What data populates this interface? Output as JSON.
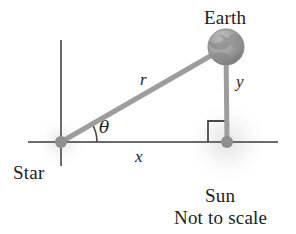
{
  "figure": {
    "type": "geometry-diagram",
    "caption": "Not to scale",
    "background_color": "#ffffff",
    "stroke_color": "#8a8a8a",
    "axis_color": "#6b6b6b",
    "text_color": "#1d1d1d"
  },
  "labels": {
    "earth": "Earth",
    "star": "Star",
    "sun": "Sun",
    "not_to_scale": "Not to scale",
    "r": "r",
    "x": "x",
    "y": "y",
    "theta": "θ"
  },
  "bodies": [
    {
      "name": "star",
      "label": "Star",
      "cx": 61,
      "cy": 142,
      "dot_radius": 6,
      "glow_radius": 26,
      "color": "#8f8f8f"
    },
    {
      "name": "sun",
      "label": "Sun",
      "cx": 227,
      "cy": 142,
      "dot_radius": 6,
      "glow_radius": 42,
      "color": "#8f8f8f"
    },
    {
      "name": "earth",
      "label": "Earth",
      "cx": 226,
      "cy": 47,
      "radius": 18,
      "color": "#9a9a9a"
    }
  ],
  "segments": [
    {
      "name": "hypotenuse-r",
      "label": "r",
      "from": "star",
      "to": "earth",
      "x1": 61,
      "y1": 142,
      "x2": 226,
      "y2": 47,
      "width": 5,
      "color": "#9d9d9d"
    },
    {
      "name": "vertical-y",
      "label": "y",
      "from": "earth",
      "to": "sun",
      "x1": 226,
      "y1": 47,
      "x2": 227,
      "y2": 142,
      "width": 5,
      "color": "#9d9d9d"
    },
    {
      "name": "horizontal-x",
      "label": "x",
      "from": "star",
      "to": "sun",
      "x1": 61,
      "y1": 142,
      "x2": 227,
      "y2": 142,
      "width": 2,
      "color": "#7d7d7d"
    }
  ],
  "axes": {
    "horizontal": {
      "x1": 28,
      "y1": 142,
      "x2": 278,
      "y2": 142,
      "width": 2,
      "color": "#6b6b6b"
    },
    "vertical": {
      "x1": 61,
      "y1": 40,
      "x2": 61,
      "y2": 166,
      "width": 2,
      "color": "#6b6b6b"
    }
  },
  "angle_marker": {
    "name": "theta-arc",
    "vertex_x": 61,
    "vertex_y": 142,
    "radius": 36,
    "label": "θ",
    "degrees": 30,
    "color": "#4a4a4a"
  },
  "right_angle_marker": {
    "name": "right-angle-square",
    "x": 208,
    "y": 121,
    "size": 20,
    "color": "#4a4a4a"
  }
}
